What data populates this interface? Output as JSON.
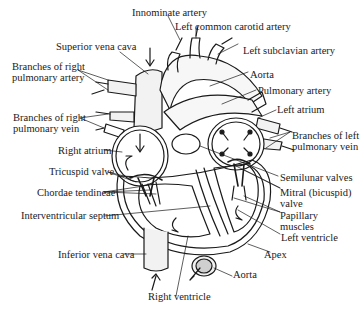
{
  "diagram": {
    "labels": {
      "innominate_artery": "Innominate artery",
      "left_common_carotid_artery": "Left common carotid artery",
      "superior_vena_cava": "Superior vena cava",
      "left_subclavian_artery": "Left subclavian artery",
      "branches_right_pulmonary_artery": [
        "Branches of right",
        "pulmonary artery"
      ],
      "aorta_top": "Aorta",
      "pulmonary_artery": "Pulmonary artery",
      "branches_right_pulmonary_vein": [
        "Branches of right",
        "pulmonary vein"
      ],
      "left_atrium": "Left atrium",
      "branches_left_pulmonary_vein": [
        "Branches of left",
        "pulmonary vein"
      ],
      "right_atrium": "Right atrium",
      "semilunar_valves": "Semilunar valves",
      "tricuspid_valve": "Tricuspid valve",
      "mitral_valve": [
        "Mitral (bicuspid)",
        "valve"
      ],
      "chordae_tendineae": "Chordae tendineae",
      "papillary_muscles": [
        "Papillary",
        "muscles"
      ],
      "interventricular_septum": "Interventricular septum",
      "left_ventricle": "Left ventricle",
      "apex": "Apex",
      "inferior_vena_cava": "Inferior vena cava",
      "aorta_bottom": "Aorta",
      "right_ventricle": "Right ventricle"
    }
  }
}
